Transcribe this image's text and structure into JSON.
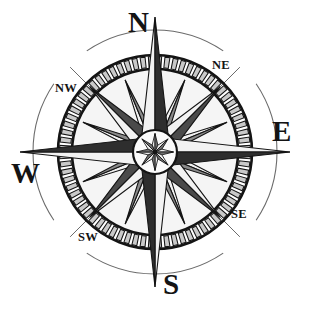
{
  "image": {
    "title": "Compass Rose",
    "type": "line-art-illustration",
    "background_color": "#ffffff",
    "width": 310,
    "height": 311
  },
  "compass": {
    "center": {
      "x": 155,
      "y": 152
    },
    "outer_circle_radius": 122,
    "ring_outer_radius": 97,
    "ring_inner_radius": 83,
    "tick_count": 72,
    "hub_radius": 22,
    "colors": {
      "ink": "#141414",
      "tick_fill": "#c9c9c9",
      "light_face": "#f2f2f2",
      "dark_face": "#4a4a4a",
      "mid_face": "#8a8a8a",
      "outline_circle": "#6b6b6b",
      "face_background": "#f5f5f5"
    },
    "cardinal_points": [
      {
        "key": "n",
        "label": "N",
        "angle_deg": 0,
        "class": "card"
      },
      {
        "key": "e",
        "label": "E",
        "angle_deg": 90,
        "class": "card"
      },
      {
        "key": "s",
        "label": "S",
        "angle_deg": 180,
        "class": "card"
      },
      {
        "key": "w",
        "label": "W",
        "angle_deg": 270,
        "class": "card"
      }
    ],
    "intercardinal_points": [
      {
        "key": "ne",
        "label": "NE",
        "angle_deg": 45,
        "class": "inter"
      },
      {
        "key": "se",
        "label": "SE",
        "angle_deg": 135,
        "class": "inter"
      },
      {
        "key": "sw",
        "label": "SW",
        "angle_deg": 225,
        "class": "inter"
      },
      {
        "key": "nw",
        "label": "NW",
        "angle_deg": 315,
        "class": "inter"
      }
    ],
    "star": {
      "major_points": 8,
      "minor_points": 8,
      "cardinal_spike_length": 135,
      "intercardinal_point_length": 92,
      "minor_point_length": 78,
      "shading": "left-half-light / right-half-dark"
    }
  }
}
